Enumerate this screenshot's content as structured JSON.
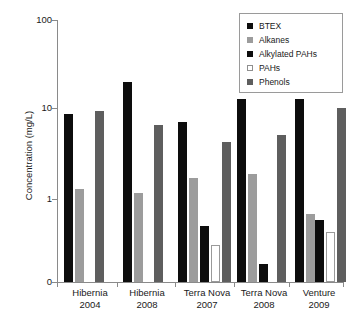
{
  "chart_data": {
    "type": "bar",
    "title": "",
    "xlabel": "",
    "ylabel": "Concentration (mg/L)",
    "yscale": "log",
    "ylim": [
      0,
      100
    ],
    "ytick_labels": [
      "100",
      "10",
      "1",
      "0"
    ],
    "ytick_values": [
      100,
      10,
      1,
      0
    ],
    "grid": false,
    "legend_position": "top-right",
    "categories": [
      "Hibernia 2004",
      "Hibernia 2008",
      "Terra Nova 2007",
      "Terra Nova 2008",
      "Venture 2009"
    ],
    "category_lines": [
      {
        "line1": "Hibernia",
        "line2": "2004"
      },
      {
        "line1": "Hibernia",
        "line2": "2008"
      },
      {
        "line1": "Terra Nova",
        "line2": "2007"
      },
      {
        "line1": "Terra Nova",
        "line2": "2008"
      },
      {
        "line1": "Venture",
        "line2": "2009"
      }
    ],
    "series": [
      {
        "name": "BTEX",
        "color": "#0d0d0d",
        "values": [
          8.5,
          20.0,
          7.0,
          12.5,
          12.5
        ]
      },
      {
        "name": "Alkanes",
        "color": "#9c9c9c",
        "values": [
          1.3,
          1.15,
          1.7,
          1.9,
          0.55
        ]
      },
      {
        "name": "Alkylated PAHs",
        "color": "#0d0d0d",
        "values": [
          null,
          null,
          0.35,
          0.08,
          0.45
        ]
      },
      {
        "name": "PAHs",
        "color": "#ffffff",
        "values": [
          null,
          null,
          0.17,
          null,
          0.28
        ]
      },
      {
        "name": "Phenols",
        "color": "#5e5e5e",
        "values": [
          9.2,
          6.5,
          4.2,
          5.0,
          10.0
        ]
      }
    ]
  },
  "legend": {
    "items": [
      {
        "label": "BTEX",
        "swatch": "legend-swatch-btex"
      },
      {
        "label": "Alkanes",
        "swatch": "legend-swatch-alkanes"
      },
      {
        "label": "Alkylated PAHs",
        "swatch": "legend-swatch-alkylated-pahs"
      },
      {
        "label": "PAHs",
        "swatch": "legend-swatch-pahs"
      },
      {
        "label": "Phenols",
        "swatch": "legend-swatch-phenols"
      }
    ]
  },
  "axes": {
    "y_title": "Concentration (mg/L)",
    "y_labels": [
      "100",
      "10",
      "1",
      "0"
    ]
  },
  "colors": {
    "btex": "#0d0d0d",
    "alkanes": "#9c9c9c",
    "alkylated_pahs": "#0d0d0d",
    "pahs": "#ffffff",
    "phenols": "#5e5e5e",
    "axis": "#8a8a8a",
    "text": "#1a1a1a",
    "background": "#ffffff"
  }
}
